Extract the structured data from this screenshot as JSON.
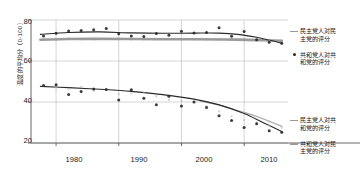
{
  "chart_data": {
    "type": "scatter",
    "title": "",
    "xlabel": "",
    "ylabel": "温度的平均分（0-100）",
    "xlim": [
      1976,
      2017
    ],
    "ylim": [
      20,
      80
    ],
    "yticks": [
      20,
      40,
      60,
      80
    ],
    "xticks": [
      1980,
      1990,
      2000,
      2010
    ],
    "grid": true,
    "legend_position": "right",
    "series": [
      {
        "name": "民主党人对民主党的评分",
        "marker": "line",
        "color": "#9a9a9a",
        "x": [
          1978,
          1980,
          1982,
          1984,
          1986,
          1988,
          1990,
          1992,
          1994,
          1996,
          1998,
          2000,
          2002,
          2004,
          2006,
          2008,
          2010,
          2012,
          2014,
          2016
        ],
        "y": [
          70.5,
          70.4,
          71.0,
          70.6,
          70.6,
          70.8,
          70.6,
          70.5,
          70.5,
          70.6,
          70.7,
          70.8,
          70.7,
          70.6,
          70.5,
          70.6,
          70.5,
          70.4,
          70.2,
          69.8
        ]
      },
      {
        "name": "共和党人对共和党的评分",
        "marker": "dot",
        "color": "#2a2a2a",
        "x": [
          1978,
          1980,
          1982,
          1984,
          1986,
          1988,
          1990,
          1992,
          1994,
          1996,
          1998,
          2000,
          2002,
          2004,
          2006,
          2008,
          2010,
          2012,
          2014,
          2016
        ],
        "y": [
          72.2,
          73.5,
          74.6,
          74.9,
          75.2,
          75.9,
          73.3,
          72.2,
          72.0,
          73.4,
          72.6,
          74.5,
          73.6,
          73.9,
          76.2,
          72.1,
          74.4,
          70.4,
          69.2,
          68.6
        ]
      },
      {
        "name": "民主党人对共和党的评分",
        "marker": "line",
        "color": "#b5b5b5",
        "x": [
          1978,
          1980,
          1982,
          1984,
          1986,
          1988,
          1990,
          1992,
          1994,
          1996,
          1998,
          2000,
          2002,
          2004,
          2006,
          2008,
          2010,
          2012,
          2014,
          2016
        ],
        "y": [
          47.8,
          47.0,
          46.4,
          47.4,
          45.6,
          46.0,
          43.8,
          44.2,
          44.6,
          42.8,
          41.0,
          40.5,
          40.2,
          38.0,
          35.4,
          33.0,
          31.2,
          30.0,
          28.4,
          27.4
        ]
      },
      {
        "name": "共和党人对民主党的评分",
        "marker": "dot",
        "color": "#2a2a2a",
        "x": [
          1978,
          1980,
          1982,
          1984,
          1986,
          1988,
          1990,
          1992,
          1994,
          1996,
          1998,
          2000,
          2002,
          2004,
          2006,
          2008,
          2010,
          2012,
          2014,
          2016
        ],
        "y": [
          48.1,
          48.4,
          43.6,
          45.1,
          46.3,
          46.1,
          41.0,
          46.0,
          41.8,
          38.6,
          42.8,
          38.0,
          40.0,
          37.3,
          33.3,
          31.0,
          27.6,
          29.4,
          26.0,
          25.2
        ]
      }
    ],
    "trend_upper_dark": {
      "x": [
        1977.5,
        1982,
        1987,
        1992,
        1997,
        2002,
        2006,
        2009,
        2012,
        2014,
        2016
      ],
      "y": [
        73.0,
        73.9,
        74.2,
        73.7,
        73.5,
        73.6,
        73.6,
        73.0,
        71.6,
        70.2,
        68.6
      ]
    },
    "trend_upper_gray": {
      "x": [
        1977.5,
        1982,
        1987,
        1992,
        1997,
        2002,
        2007,
        2012,
        2016
      ],
      "y": [
        70.4,
        70.7,
        70.8,
        70.7,
        70.6,
        70.6,
        70.5,
        70.2,
        69.9
      ]
    },
    "trend_lower_dark": {
      "x": [
        1977.5,
        1982,
        1987,
        1992,
        1997,
        2002,
        2006,
        2010,
        2013,
        2016
      ],
      "y": [
        47.6,
        47.0,
        46.2,
        45.2,
        43.6,
        41.4,
        38.6,
        34.4,
        30.0,
        25.6
      ]
    },
    "trend_lower_gray": {
      "x": [
        2003,
        2006,
        2009,
        2012,
        2014,
        2016
      ],
      "y": [
        40.5,
        38.6,
        35.8,
        33.0,
        30.6,
        28.2
      ]
    }
  },
  "axes": {
    "ylabel": "温度的平均分（0-100）",
    "yticks": [
      "80",
      "60",
      "40",
      "20"
    ],
    "xticks": [
      "1980",
      "1990",
      "2000",
      "2010"
    ]
  },
  "legend": {
    "top": [
      {
        "label": "民主党人对民\n主党的评分",
        "marker": "line"
      },
      {
        "label": "共和党人对共\n和党的评分",
        "marker": "dot"
      }
    ],
    "bottom": [
      {
        "label": "民主党人对共\n和党的评分",
        "marker": "line"
      },
      {
        "label": "共和党人对民\n主党的评分",
        "marker": "line"
      }
    ]
  },
  "colors": {
    "dark_series": "#2a2a2a",
    "gray_series": "#9a9a9a",
    "light_gray_series": "#b5b5b5",
    "grid": "#b9b9b9",
    "axis": "#555555"
  }
}
